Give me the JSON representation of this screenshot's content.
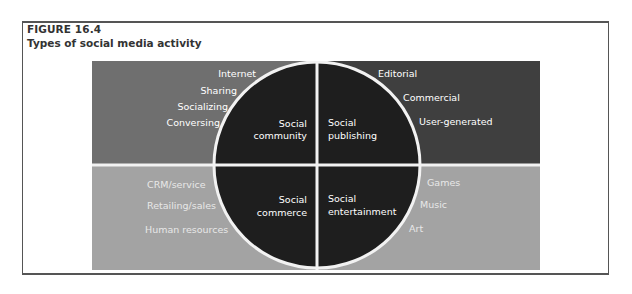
{
  "figure": {
    "label": "FIGURE 16.4",
    "title": "Types of social media activity"
  },
  "colors": {
    "top_left_panel": "#6f6f6f",
    "top_right_panel": "#3f3f3f",
    "bottom_panels": "#a3a3a3",
    "circle_fill": "#1e1e1e",
    "dividers": "#f2f2f2",
    "text": "#ffffff"
  },
  "quadrants": {
    "social_community": {
      "center_label_line1": "Social",
      "center_label_line2": "community",
      "items": [
        "Internet",
        "Sharing",
        "Socializing",
        "Conversing"
      ]
    },
    "social_publishing": {
      "center_label_line1": "Social",
      "center_label_line2": "publishing",
      "items": [
        "Editorial",
        "Commercial",
        "User-generated"
      ]
    },
    "social_commerce": {
      "center_label_line1": "Social",
      "center_label_line2": "commerce",
      "items": [
        "CRM/service",
        "Retailing/sales",
        "Human resources"
      ]
    },
    "social_entertainment": {
      "center_label_line1": "Social",
      "center_label_line2": "entertainment",
      "items": [
        "Games",
        "Music",
        "Art"
      ]
    }
  }
}
